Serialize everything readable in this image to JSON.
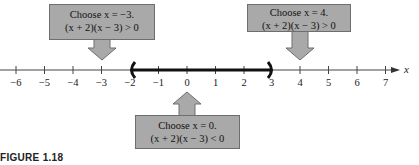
{
  "figure": {
    "caption": "FIGURE 1.18",
    "axis_variable": "x",
    "tick_labels": [
      "−6",
      "−5",
      "−4",
      "−3",
      "−2",
      "−1",
      "0",
      "1",
      "2",
      "3",
      "4",
      "5",
      "6",
      "7"
    ],
    "tick_values": [
      -6,
      -5,
      -4,
      -3,
      -2,
      -1,
      0,
      1,
      2,
      3,
      4,
      5,
      6,
      7
    ],
    "interval": {
      "left": -2,
      "right": 3,
      "left_bracket": "(",
      "right_bracket": ")"
    },
    "callouts": [
      {
        "id": "left",
        "test_point": -3,
        "line1": "Choose x = −3.",
        "line2": "(x + 2)(x − 3) > 0"
      },
      {
        "id": "right",
        "test_point": 4,
        "line1": "Choose x = 4.",
        "line2": "(x + 2)(x − 3) > 0"
      },
      {
        "id": "middle",
        "test_point": 0,
        "line1": "Choose x = 0.",
        "line2": "(x + 2)(x − 3) < 0"
      }
    ],
    "colors": {
      "callout_fill": "#a9a9a9",
      "line": "#333333",
      "interval": "#111111"
    }
  }
}
